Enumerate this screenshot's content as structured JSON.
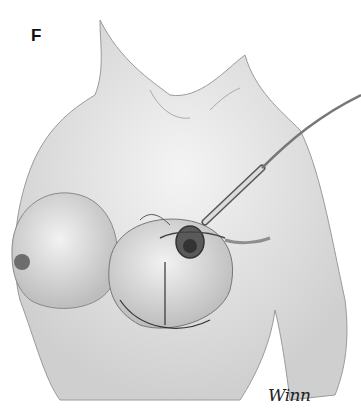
{
  "figure": {
    "panel_label": "F",
    "signature": "Winn",
    "colors": {
      "background": "#ffffff",
      "ink": "#222222",
      "skin_shade": "#c8c8c8"
    }
  }
}
